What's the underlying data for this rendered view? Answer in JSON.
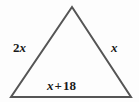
{
  "figure": {
    "name": "triangle-with-algebraic-side-labels",
    "background_color": "#fdfdfd",
    "stroke_color": "#555555",
    "stroke_width": 2,
    "text_color": "#1a1a1a",
    "vertices": {
      "apex": [
        72,
        7
      ],
      "bottom_left": [
        11,
        97
      ],
      "bottom_right": [
        131,
        97
      ]
    }
  },
  "labels": {
    "left_side": {
      "full": "2x",
      "coefficient": "2",
      "variable": "x"
    },
    "right_side": {
      "full": "x",
      "variable": "x"
    },
    "base": {
      "full": "x + 18",
      "variable": "x",
      "operator": "+",
      "constant": "18"
    }
  }
}
